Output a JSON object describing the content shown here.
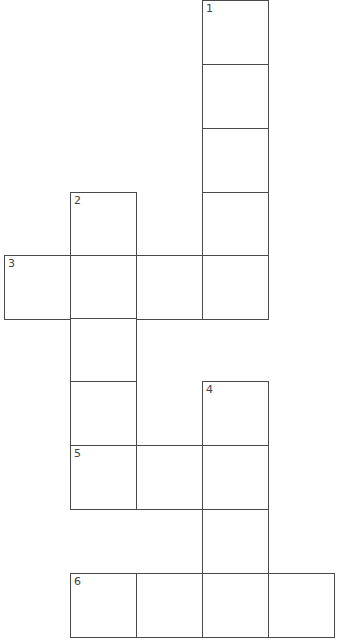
{
  "puzzle": {
    "type": "crossword",
    "colors": {
      "line": "#4a4a4a",
      "background": "#ffffff",
      "number": "#444444"
    },
    "cells": [
      {
        "row": 0,
        "col": 3,
        "number": "1",
        "value": ""
      },
      {
        "row": 1,
        "col": 3,
        "number": "",
        "value": ""
      },
      {
        "row": 2,
        "col": 3,
        "number": "",
        "value": ""
      },
      {
        "row": 3,
        "col": 3,
        "number": "",
        "value": ""
      },
      {
        "row": 4,
        "col": 3,
        "number": "",
        "value": ""
      },
      {
        "row": 3,
        "col": 1,
        "number": "2",
        "value": ""
      },
      {
        "row": 4,
        "col": 0,
        "number": "3",
        "value": ""
      },
      {
        "row": 4,
        "col": 1,
        "number": "",
        "value": ""
      },
      {
        "row": 4,
        "col": 2,
        "number": "",
        "value": ""
      },
      {
        "row": 5,
        "col": 1,
        "number": "",
        "value": ""
      },
      {
        "row": 6,
        "col": 1,
        "number": "",
        "value": ""
      },
      {
        "row": 6,
        "col": 3,
        "number": "4",
        "value": ""
      },
      {
        "row": 7,
        "col": 1,
        "number": "5",
        "value": ""
      },
      {
        "row": 7,
        "col": 2,
        "number": "",
        "value": ""
      },
      {
        "row": 7,
        "col": 3,
        "number": "",
        "value": ""
      },
      {
        "row": 8,
        "col": 3,
        "number": "",
        "value": ""
      },
      {
        "row": 9,
        "col": 1,
        "number": "6",
        "value": ""
      },
      {
        "row": 9,
        "col": 2,
        "number": "",
        "value": ""
      },
      {
        "row": 9,
        "col": 3,
        "number": "",
        "value": ""
      },
      {
        "row": 9,
        "col": 4,
        "number": "",
        "value": ""
      }
    ],
    "entries": [
      {
        "number": "1",
        "direction": "down",
        "length": 5
      },
      {
        "number": "2",
        "direction": "down",
        "length": 5
      },
      {
        "number": "3",
        "direction": "across",
        "length": 4
      },
      {
        "number": "4",
        "direction": "down",
        "length": 4
      },
      {
        "number": "5",
        "direction": "across",
        "length": 3
      },
      {
        "number": "6",
        "direction": "across",
        "length": 4
      }
    ]
  }
}
